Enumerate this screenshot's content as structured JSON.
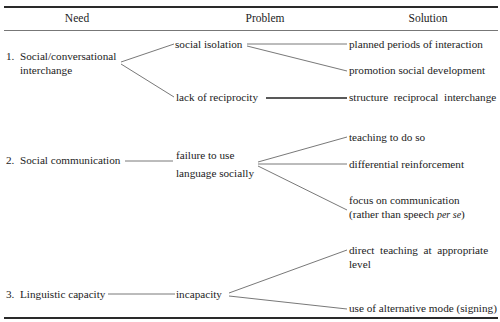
{
  "table": {
    "headers": {
      "need": "Need",
      "problem": "Problem",
      "solution": "Solution"
    },
    "rows": [
      {
        "number": "1.",
        "need_line1": "Social/conversational",
        "need_line2": "interchange",
        "problems": [
          {
            "label": "social isolation",
            "solutions": [
              "planned periods of interaction",
              "promotion social development"
            ]
          },
          {
            "label": "lack of reciprocity",
            "solutions": [
              "structure  reciprocal  interchange"
            ]
          }
        ]
      },
      {
        "number": "2.",
        "need_line1": "Social communication",
        "problems": [
          {
            "label_line1": "failure to use",
            "label_line2": "language socially",
            "solutions": [
              "teaching to do so",
              "differential reinforcement",
              {
                "line1": "focus on communication",
                "line2_prefix": "(rather than speech ",
                "line2_italic": "per se",
                "line2_suffix": ")"
              }
            ]
          }
        ]
      },
      {
        "number": "3.",
        "need_line1": "Linguistic capacity",
        "problems": [
          {
            "label": "incapacity",
            "solutions": [
              {
                "line1": "direct  teaching  at  appropriate",
                "line2": "level"
              },
              "use of alternative mode (signing)"
            ]
          }
        ]
      }
    ]
  },
  "colors": {
    "text": "#1c1c1c",
    "rules": "#2a2a2a",
    "connectors": "#555555"
  }
}
